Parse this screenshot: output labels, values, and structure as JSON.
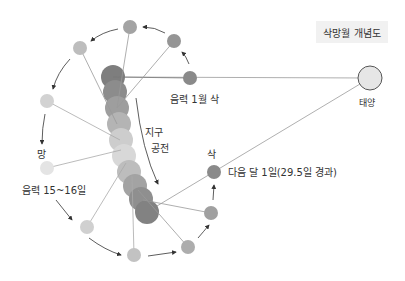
{
  "title": "삭망월 개념도",
  "labels": {
    "sun": "태양",
    "new_moon_month1": "음력 1월 삭",
    "earth_orbit_line1": "지구",
    "earth_orbit_line2": "공전",
    "full_moon": "망",
    "full_moon_date": "음력 15~16일",
    "next_new_moon": "삭",
    "next_new_moon_date": "다음 달 1일(29.5일 경과)"
  },
  "colors": {
    "earth_dark": "#7e7e7e",
    "earth_light": "#d8d8d8",
    "moon_dark": "#8a8a8a",
    "moon_light": "#e0e0e0",
    "line": "#9a9a9a",
    "arrow": "#333333",
    "sun_fill": "#e6e6e6",
    "sun_stroke": "#555555"
  },
  "sun": {
    "x": 370,
    "y": 78,
    "r": 12
  },
  "earth_positions": [
    {
      "x": 113,
      "y": 77
    },
    {
      "x": 115,
      "y": 92
    },
    {
      "x": 117,
      "y": 108
    },
    {
      "x": 119,
      "y": 124
    },
    {
      "x": 121,
      "y": 140
    },
    {
      "x": 124,
      "y": 156
    },
    {
      "x": 129,
      "y": 172
    },
    {
      "x": 135,
      "y": 186
    },
    {
      "x": 141,
      "y": 199
    },
    {
      "x": 147,
      "y": 212
    }
  ],
  "moons": [
    {
      "id": "new-moon-month1",
      "x": 190,
      "y": 78,
      "shade": "#8a8a8a"
    },
    {
      "id": "moon-2",
      "x": 174,
      "y": 41,
      "shade": "#959595"
    },
    {
      "id": "moon-3",
      "x": 130,
      "y": 27,
      "shade": "#a3a3a3"
    },
    {
      "id": "moon-4",
      "x": 80,
      "y": 48,
      "shade": "#bdbdbd"
    },
    {
      "id": "moon-5",
      "x": 47,
      "y": 101,
      "shade": "#d2d2d2"
    },
    {
      "id": "full-moon",
      "x": 47,
      "y": 168,
      "shade": "#e4e4e4"
    },
    {
      "id": "moon-7",
      "x": 87,
      "y": 227,
      "shade": "#d0d0d0"
    },
    {
      "id": "moon-8",
      "x": 134,
      "y": 255,
      "shade": "#c2c2c2"
    },
    {
      "id": "moon-9",
      "x": 188,
      "y": 247,
      "shade": "#adadad"
    },
    {
      "id": "moon-10",
      "x": 211,
      "y": 213,
      "shade": "#a0a0a0"
    },
    {
      "id": "next-new-moon",
      "x": 214,
      "y": 172,
      "shade": "#8a8a8a"
    }
  ]
}
